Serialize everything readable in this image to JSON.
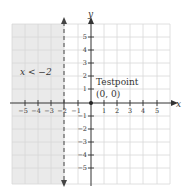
{
  "diagram": {
    "type": "inequality-graph",
    "inequality_label": "x < −2",
    "test_point_label": "Testpoint",
    "test_point_coords": "(0, 0)",
    "axis_labels": {
      "x": "x",
      "y": "y"
    },
    "x_ticks": [
      "−5",
      "−4",
      "−3",
      "−2",
      "−1",
      "1",
      "2",
      "3",
      "4",
      "5"
    ],
    "y_ticks": [
      "5",
      "4",
      "3",
      "2",
      "1",
      "−1",
      "−2",
      "−3",
      "−4",
      "−5"
    ],
    "boundary": {
      "equation": "x = −2",
      "style": "dashed"
    },
    "shaded_region": "left of x = −2",
    "colors": {
      "shade": "#eaeaea",
      "grid": "#d8d8d8",
      "axis": "#333333"
    }
  }
}
